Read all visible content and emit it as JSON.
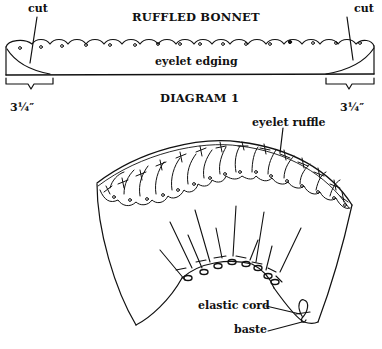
{
  "diagram": {
    "title": "RUFFLED BONNET",
    "caption": "DIAGRAM 1",
    "labels": {
      "cut_left": "cut",
      "cut_right": "cut",
      "eyelet_edging": "eyelet edging",
      "measure_left": "3¼″",
      "measure_right": "3¼″",
      "eyelet_ruffle": "eyelet ruffle",
      "elastic_cord": "elastic cord",
      "baste": "baste"
    },
    "colors": {
      "ink": "#111111",
      "paper": "#ffffff"
    }
  }
}
